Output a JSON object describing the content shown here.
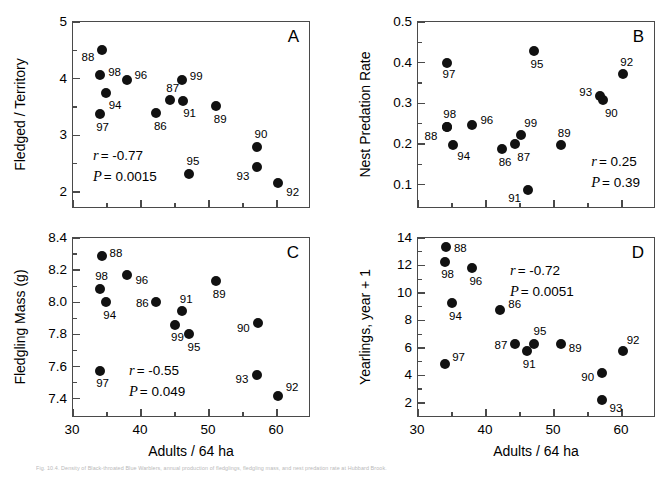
{
  "figure": {
    "caption": "Fig. 10.4. Density of Black-throated Blue Warblers, annual production of fledglings, fledgling mass, and nest predation rate at Hubbard Brook."
  },
  "chart_data": [
    {
      "id": "A",
      "type": "scatter",
      "panel_letter": "A",
      "title": "",
      "xlabel": "",
      "ylabel": "Fledged / Territory",
      "xlim": [
        30,
        65
      ],
      "ylim": [
        1.7,
        5.0
      ],
      "xticks": [
        30,
        40,
        50,
        60
      ],
      "xticklabels": [
        "",
        "",
        "",
        ""
      ],
      "xminor": [
        35,
        45,
        55
      ],
      "yticks": [
        2,
        3,
        4,
        5
      ],
      "yticklabels": [
        "2",
        "3",
        "4",
        "5"
      ],
      "yminor": [
        2.5,
        3.5,
        4.5
      ],
      "grid": false,
      "stats": {
        "r_label": "r",
        "r_value": "= -0.77",
        "p_label": "P",
        "p_value": "= 0.0015"
      },
      "points": [
        {
          "label": "88",
          "x": 34.2,
          "y": 4.5,
          "lx": -20,
          "ly": 7
        },
        {
          "label": "98",
          "x": 34.0,
          "y": 4.07,
          "lx": 8,
          "ly": -3
        },
        {
          "label": "94",
          "x": 34.8,
          "y": 3.75,
          "lx": 3,
          "ly": 12
        },
        {
          "label": "97",
          "x": 34.0,
          "y": 3.38,
          "lx": -4,
          "ly": 13
        },
        {
          "label": "96",
          "x": 38.0,
          "y": 3.97,
          "lx": 7,
          "ly": -5
        },
        {
          "label": "86",
          "x": 42.2,
          "y": 3.4,
          "lx": -2,
          "ly": 13
        },
        {
          "label": "87",
          "x": 44.3,
          "y": 3.63,
          "lx": -4,
          "ly": -12
        },
        {
          "label": "91",
          "x": 46.2,
          "y": 3.6,
          "lx": 0,
          "ly": 12
        },
        {
          "label": "99",
          "x": 46.0,
          "y": 3.97,
          "lx": 8,
          "ly": -4
        },
        {
          "label": "95",
          "x": 47.0,
          "y": 2.31,
          "lx": -2,
          "ly": -13
        },
        {
          "label": "89",
          "x": 51.0,
          "y": 3.52,
          "lx": -2,
          "ly": 13
        },
        {
          "label": "90",
          "x": 57.0,
          "y": 2.79,
          "lx": -2,
          "ly": -13
        },
        {
          "label": "93",
          "x": 57.0,
          "y": 2.44,
          "lx": -20,
          "ly": 9
        },
        {
          "label": "92",
          "x": 60.2,
          "y": 2.16,
          "lx": 8,
          "ly": 9
        }
      ]
    },
    {
      "id": "B",
      "type": "scatter",
      "panel_letter": "B",
      "title": "",
      "xlabel": "",
      "ylabel": "Nest Predation Rate",
      "xlim": [
        30,
        65
      ],
      "ylim": [
        0.04,
        0.5
      ],
      "xticks": [
        30,
        40,
        50,
        60
      ],
      "xticklabels": [
        "",
        "",
        "",
        ""
      ],
      "xminor": [
        35,
        45,
        55
      ],
      "yticks": [
        0.1,
        0.2,
        0.3,
        0.4,
        0.5
      ],
      "yticklabels": [
        "0.1",
        "0.2",
        "0.3",
        "0.4",
        "0.5"
      ],
      "yminor": [
        0.15,
        0.25,
        0.35,
        0.45
      ],
      "grid": false,
      "stats": {
        "r_label": "r",
        "r_value": "= 0.25",
        "p_label": "P",
        "p_value": "= 0.39"
      },
      "points": [
        {
          "label": "97",
          "x": 34.2,
          "y": 0.399,
          "lx": -4,
          "ly": 11
        },
        {
          "label": "88",
          "x": 34.2,
          "y": 0.241,
          "lx": -22,
          "ly": 9
        },
        {
          "label": "98",
          "x": 34.3,
          "y": 0.242,
          "lx": -4,
          "ly": -13
        },
        {
          "label": "94",
          "x": 35.2,
          "y": 0.197,
          "lx": 4,
          "ly": 11
        },
        {
          "label": "96",
          "x": 38.0,
          "y": 0.247,
          "lx": 8,
          "ly": -5
        },
        {
          "label": "86",
          "x": 42.3,
          "y": 0.187,
          "lx": -3,
          "ly": 13
        },
        {
          "label": "87",
          "x": 44.3,
          "y": 0.201,
          "lx": 2,
          "ly": 13
        },
        {
          "label": "99",
          "x": 45.2,
          "y": 0.222,
          "lx": 3,
          "ly": -12
        },
        {
          "label": "91",
          "x": 46.2,
          "y": 0.086,
          "lx": -20,
          "ly": 8
        },
        {
          "label": "95",
          "x": 47.0,
          "y": 0.428,
          "lx": -3,
          "ly": 13
        },
        {
          "label": "89",
          "x": 51.0,
          "y": 0.197,
          "lx": -3,
          "ly": -12
        },
        {
          "label": "93",
          "x": 56.8,
          "y": 0.318,
          "lx": -21,
          "ly": -4
        },
        {
          "label": "90",
          "x": 57.2,
          "y": 0.308,
          "lx": 2,
          "ly": 13
        },
        {
          "label": "92",
          "x": 60.2,
          "y": 0.372,
          "lx": -3,
          "ly": -12
        }
      ]
    },
    {
      "id": "C",
      "type": "scatter",
      "panel_letter": "C",
      "title": "",
      "xlabel": "Adults / 64 ha",
      "ylabel": "Fledgling Mass (g)",
      "xlim": [
        30,
        65
      ],
      "ylim": [
        7.28,
        8.4
      ],
      "xticks": [
        30,
        40,
        50,
        60
      ],
      "xticklabels": [
        "30",
        "40",
        "50",
        "60"
      ],
      "xminor": [
        35,
        45,
        55
      ],
      "yticks": [
        7.4,
        7.6,
        7.8,
        8.0,
        8.2,
        8.4
      ],
      "yticklabels": [
        "7.4",
        "7.6",
        "7.8",
        "8.0",
        "8.2",
        "8.4"
      ],
      "yminor": [
        7.5,
        7.7,
        7.9,
        8.1,
        8.3
      ],
      "grid": false,
      "stats": {
        "r_label": "r",
        "r_value": "= -0.55",
        "p_label": "P",
        "p_value": "= 0.049"
      },
      "points": [
        {
          "label": "88",
          "x": 34.2,
          "y": 8.285,
          "lx": 8,
          "ly": -3
        },
        {
          "label": "98",
          "x": 34.0,
          "y": 8.085,
          "lx": -5,
          "ly": -13
        },
        {
          "label": "94",
          "x": 34.9,
          "y": 8.0,
          "lx": -3,
          "ly": 13
        },
        {
          "label": "97",
          "x": 34.0,
          "y": 7.57,
          "lx": -4,
          "ly": 12
        },
        {
          "label": "96",
          "x": 38.0,
          "y": 8.17,
          "lx": 8,
          "ly": 5
        },
        {
          "label": "86",
          "x": 42.2,
          "y": 8.0,
          "lx": -20,
          "ly": 1
        },
        {
          "label": "91",
          "x": 46.0,
          "y": 7.948,
          "lx": -2,
          "ly": -12
        },
        {
          "label": "99",
          "x": 45.0,
          "y": 7.86,
          "lx": -4,
          "ly": 12
        },
        {
          "label": "95",
          "x": 47.0,
          "y": 7.805,
          "lx": -1,
          "ly": 13
        },
        {
          "label": "89",
          "x": 51.0,
          "y": 8.13,
          "lx": -3,
          "ly": 13
        },
        {
          "label": "90",
          "x": 57.2,
          "y": 7.87,
          "lx": -21,
          "ly": 5
        },
        {
          "label": "93",
          "x": 57.0,
          "y": 7.548,
          "lx": -21,
          "ly": 4
        },
        {
          "label": "92",
          "x": 60.1,
          "y": 7.42,
          "lx": 8,
          "ly": -9
        }
      ]
    },
    {
      "id": "D",
      "type": "scatter",
      "panel_letter": "D",
      "title": "",
      "xlabel": "Adults / 64 ha",
      "ylabel": "Yearlings, year + 1",
      "xlim": [
        30,
        65
      ],
      "ylim": [
        0.9,
        14
      ],
      "xticks": [
        30,
        40,
        50,
        60
      ],
      "xticklabels": [
        "30",
        "40",
        "50",
        "60"
      ],
      "xminor": [
        35,
        45,
        55
      ],
      "yticks": [
        2,
        4,
        6,
        8,
        10,
        12,
        14
      ],
      "yticklabels": [
        "2",
        "4",
        "6",
        "8",
        "10",
        "12",
        "14"
      ],
      "yminor": [
        3,
        5,
        7,
        9,
        11,
        13
      ],
      "grid": false,
      "stats": {
        "r_label": "r",
        "r_value": "= -0.72",
        "p_label": "P",
        "p_value": "= 0.0051"
      },
      "points": [
        {
          "label": "88",
          "x": 34.1,
          "y": 13.35,
          "lx": 8,
          "ly": 1
        },
        {
          "label": "98",
          "x": 34.0,
          "y": 12.25,
          "lx": -4,
          "ly": 12
        },
        {
          "label": "96",
          "x": 38.0,
          "y": 11.8,
          "lx": -3,
          "ly": 13
        },
        {
          "label": "94",
          "x": 35.0,
          "y": 9.3,
          "lx": -3,
          "ly": 13
        },
        {
          "label": "86",
          "x": 42.1,
          "y": 8.75,
          "lx": 8,
          "ly": -6
        },
        {
          "label": "97",
          "x": 34.0,
          "y": 4.8,
          "lx": 7,
          "ly": -7
        },
        {
          "label": "87",
          "x": 44.2,
          "y": 6.25,
          "lx": -20,
          "ly": 1
        },
        {
          "label": "91",
          "x": 46.0,
          "y": 5.8,
          "lx": -4,
          "ly": 13
        },
        {
          "label": "95",
          "x": 47.0,
          "y": 6.25,
          "lx": 0,
          "ly": -13
        },
        {
          "label": "89",
          "x": 51.0,
          "y": 6.25,
          "lx": 8,
          "ly": 4
        },
        {
          "label": "90",
          "x": 57.1,
          "y": 4.2,
          "lx": -21,
          "ly": 4
        },
        {
          "label": "93",
          "x": 57.0,
          "y": 2.2,
          "lx": 8,
          "ly": 8
        },
        {
          "label": "92",
          "x": 60.1,
          "y": 5.75,
          "lx": 4,
          "ly": -11
        }
      ]
    }
  ]
}
